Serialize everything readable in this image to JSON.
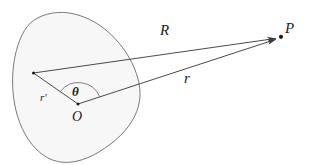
{
  "figure": {
    "type": "vector-geometry-diagram",
    "background_color": "#ffffff",
    "stroke_color": "#555555",
    "ink_color": "#1b1b1b",
    "body": {
      "name": "charge-distribution-blob",
      "fill_color": "#f7f7f7",
      "outline_color": "#6b6b6b"
    },
    "labels": {
      "R": "R",
      "r": "r",
      "r_prime": "r′",
      "theta": "θ",
      "origin": "O",
      "field_point": "P"
    },
    "points": {
      "origin_label": "O",
      "origin_x": 78,
      "origin_y": 104,
      "source_x": 33,
      "source_y": 73,
      "field_point_label": "P",
      "field_point_x": 281,
      "field_point_y": 37
    },
    "vectors": [
      {
        "name": "r-prime",
        "label": "r′",
        "from": "O",
        "to": "source-point",
        "arrow": false
      },
      {
        "name": "R",
        "label": "R",
        "from": "source-point",
        "to": "P",
        "arrow": true
      },
      {
        "name": "r",
        "label": "r",
        "from": "O",
        "to": "P",
        "arrow": true
      }
    ],
    "angle": {
      "name": "theta",
      "label": "θ",
      "vertex": "O",
      "between": [
        "r′",
        "r"
      ]
    }
  }
}
